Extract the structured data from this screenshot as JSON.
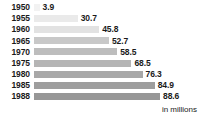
{
  "chart_data": {
    "type": "bar",
    "orientation": "horizontal",
    "title": "",
    "subtitle": "",
    "xlabel": "",
    "ylabel": "",
    "units_note": "in millions",
    "grid": false,
    "legend": "none",
    "xlim": [
      0,
      88.6
    ],
    "categories": [
      "1950",
      "1955",
      "1960",
      "1965",
      "1970",
      "1975",
      "1980",
      "1985",
      "1988"
    ],
    "values": [
      3.9,
      30.7,
      45.8,
      52.7,
      58.5,
      68.5,
      76.3,
      84.9,
      88.6
    ],
    "value_labels": [
      "3.9",
      "30.7",
      "45.8",
      "52.7",
      "58.5",
      "68.5",
      "76.3",
      "84.9",
      "88.6"
    ],
    "bar_colors": [
      "#f2f2f2",
      "#eaeaea",
      "#e2e2e2",
      "#c8c8c8",
      "#bdbdbd",
      "#b5b5b5",
      "#a8a8a8",
      "#9e9e9e",
      "#979797"
    ],
    "background_color": "#ffffff",
    "text_color": "#1a1a1a"
  }
}
